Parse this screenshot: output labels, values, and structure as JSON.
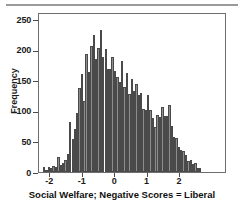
{
  "chart_data": {
    "type": "bar",
    "title": "",
    "subtitle": "",
    "xlabel": "Social Welfare; Negative Scores = Liberal",
    "ylabel": "Frequency",
    "xlim": [
      -2.35,
      3.45
    ],
    "ylim": [
      0,
      262
    ],
    "grid": false,
    "legend": null,
    "xticks": [
      -2,
      -1,
      0,
      1,
      2
    ],
    "xtick_labels": [
      "-2",
      "-1",
      "0",
      "1",
      "2"
    ],
    "yticks": [
      0,
      50,
      100,
      150,
      200,
      250
    ],
    "ytick_labels": [
      "0",
      "50",
      "100",
      "150",
      "200",
      "250"
    ],
    "bin_width": 0.0725,
    "x": [
      -2.19,
      -2.12,
      -2.04,
      -1.97,
      -1.9,
      -1.82,
      -1.75,
      -1.68,
      -1.61,
      -1.53,
      -1.46,
      -1.39,
      -1.31,
      -1.24,
      -1.17,
      -1.1,
      -1.02,
      -0.95,
      -0.88,
      -0.8,
      -0.73,
      -0.66,
      -0.59,
      -0.51,
      -0.44,
      -0.37,
      -0.29,
      -0.22,
      -0.15,
      -0.08,
      0.0,
      0.07,
      0.15,
      0.22,
      0.29,
      0.36,
      0.44,
      0.51,
      0.58,
      0.66,
      0.73,
      0.8,
      0.87,
      0.95,
      1.02,
      1.09,
      1.17,
      1.24,
      1.31,
      1.38,
      1.46,
      1.53,
      1.6,
      1.68,
      1.75,
      1.82,
      1.89,
      1.97,
      2.04,
      2.11,
      2.19,
      2.26,
      2.33,
      2.4,
      2.48,
      2.55,
      2.62
    ],
    "values": [
      8,
      4,
      9,
      6,
      10,
      8,
      24,
      12,
      15,
      20,
      30,
      82,
      54,
      71,
      97,
      137,
      161,
      117,
      193,
      164,
      206,
      224,
      185,
      203,
      232,
      188,
      202,
      168,
      168,
      188,
      166,
      155,
      148,
      181,
      140,
      162,
      127,
      152,
      132,
      144,
      126,
      130,
      103,
      101,
      126,
      102,
      88,
      73,
      93,
      90,
      107,
      91,
      92,
      109,
      76,
      57,
      56,
      41,
      36,
      34,
      28,
      18,
      19,
      13,
      14,
      7,
      6
    ],
    "bar_color": "#8d8d8d",
    "bar_edge_color": "#4a4a4a"
  }
}
